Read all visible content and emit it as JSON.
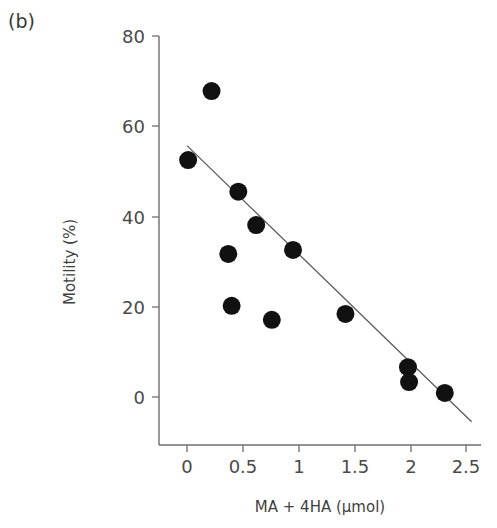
{
  "panel": {
    "label": "(b)"
  },
  "chart_data": {
    "type": "scatter",
    "title": "",
    "subtitle": "",
    "xlabel": "MA + 4HA (µmol)",
    "ylabel": "Motility (%)",
    "xlim": [
      -0.25,
      2.65
    ],
    "ylim": [
      -7,
      82
    ],
    "xticks": [
      0,
      0.5,
      1,
      1.5,
      2,
      2.5
    ],
    "xtick_labels": [
      "0",
      "0.5",
      "1",
      "1.5",
      "2",
      "2.5"
    ],
    "yticks": [
      0,
      20,
      40,
      60,
      80
    ],
    "ytick_labels": [
      "0",
      "20",
      "40",
      "60",
      "80"
    ],
    "grid": false,
    "legend": null,
    "marker": {
      "shape": "circle",
      "color": "#111111",
      "size_px": 18
    },
    "series": [
      {
        "name": "Motility vs MA + 4HA",
        "x": [
          0.01,
          0.22,
          0.37,
          0.4,
          0.46,
          0.62,
          0.76,
          0.95,
          1.42,
          1.98,
          1.99,
          2.31
        ],
        "y": [
          52.5,
          67.8,
          31.7,
          20.2,
          45.5,
          38.1,
          17.1,
          32.6,
          18.4,
          6.6,
          3.3,
          0.9
        ]
      }
    ],
    "fit_line": {
      "type": "linear",
      "x_start": 0.0,
      "y_start": 55.7,
      "x_end": 2.55,
      "y_end": -5.5,
      "color": "#5a5a5a"
    }
  },
  "axes_geometry": {
    "x_zero_px": 187,
    "px_per_x_unit": 111.6,
    "y_zero_px": 397,
    "px_per_y_unit": 4.5125,
    "x_axis_y_px": 445,
    "y_axis_x_px": 159
  }
}
